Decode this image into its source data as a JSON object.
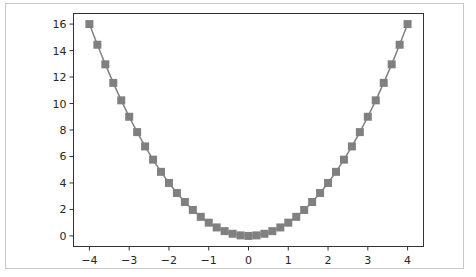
{
  "chart_data": {
    "type": "line",
    "title": "",
    "xlabel": "",
    "ylabel": "",
    "xlim": [
      -4.4,
      4.4
    ],
    "ylim": [
      -0.8,
      16.8
    ],
    "grid": false,
    "legend": null,
    "marker": "square",
    "color": "#808080",
    "x_ticks": [
      -4,
      -3,
      -2,
      -1,
      0,
      1,
      2,
      3,
      4
    ],
    "y_ticks": [
      0,
      2,
      4,
      6,
      8,
      10,
      12,
      14,
      16
    ],
    "x_tick_labels": [
      "−4",
      "−3",
      "−2",
      "−1",
      "0",
      "1",
      "2",
      "3",
      "4"
    ],
    "y_tick_labels": [
      "0",
      "2",
      "4",
      "6",
      "8",
      "10",
      "12",
      "14",
      "16"
    ],
    "x": [
      -4.0,
      -3.8,
      -3.6,
      -3.4,
      -3.2,
      -3.0,
      -2.8,
      -2.6,
      -2.4,
      -2.2,
      -2.0,
      -1.8,
      -1.6,
      -1.4,
      -1.2,
      -1.0,
      -0.8,
      -0.6,
      -0.4,
      -0.2,
      0.0,
      0.2,
      0.4,
      0.6,
      0.8,
      1.0,
      1.2,
      1.4,
      1.6,
      1.8,
      2.0,
      2.2,
      2.4,
      2.6,
      2.8,
      3.0,
      3.2,
      3.4,
      3.6,
      3.8,
      4.0
    ],
    "values": [
      16.0,
      14.44,
      12.96,
      11.56,
      10.24,
      9.0,
      7.84,
      6.76,
      5.76,
      4.84,
      4.0,
      3.24,
      2.56,
      1.96,
      1.44,
      1.0,
      0.64,
      0.36,
      0.16,
      0.04,
      0.0,
      0.04,
      0.16,
      0.36,
      0.64,
      1.0,
      1.44,
      1.96,
      2.56,
      3.24,
      4.0,
      4.84,
      5.76,
      6.76,
      7.84,
      9.0,
      10.24,
      11.56,
      12.96,
      14.44,
      16.0
    ],
    "series": [
      {
        "name": "y = x^2",
        "color": "#808080"
      }
    ]
  }
}
